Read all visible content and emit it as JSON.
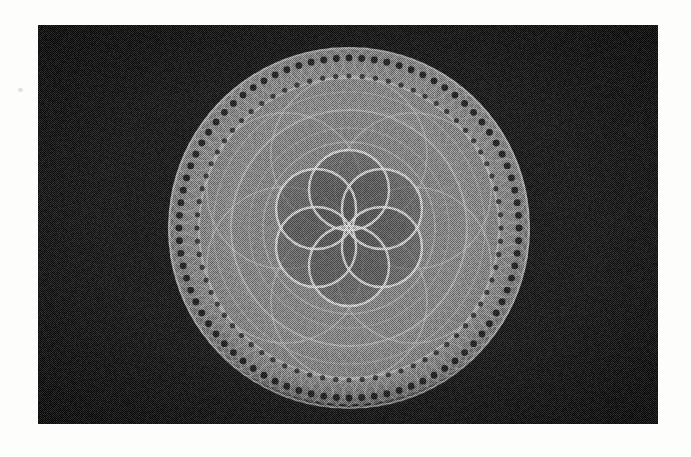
{
  "document": {
    "title": "Rosette moire figure",
    "medium": "halftone scan reproduction",
    "page_background": "#fdfdfc",
    "plate": {
      "x": 38,
      "y": 25,
      "width": 620,
      "height": 399,
      "background_color": "#171717",
      "vignette_color": "#000000"
    }
  },
  "figure": {
    "name": "spirograph-rosette",
    "center_x": 349,
    "center_y": 228,
    "outer_radius": 181,
    "tone": {
      "disk_mid": "#8a8a8a",
      "disk_bright": "#d7d7d7",
      "disk_dark": "#4a4a4a",
      "core_dark": "#565656",
      "dot_color": "#2a2a2a",
      "background": "#1b1b1b"
    },
    "rings": [
      {
        "name": "outer-bead-ring",
        "center_radius": 166,
        "circle_radius": 16,
        "count": 96,
        "stroke": "#c9c9c9",
        "opacity": 0.55,
        "width": 1.0
      },
      {
        "name": "outer-envelope-ring",
        "center_radius": 150,
        "circle_radius": 30,
        "count": 88,
        "stroke": "#bdbdbd",
        "opacity": 0.4,
        "width": 0.9
      },
      {
        "name": "broad-ring",
        "center_radius": 124,
        "circle_radius": 58,
        "count": 80,
        "stroke": "#b5b5b5",
        "opacity": 0.34,
        "width": 0.9
      },
      {
        "name": "mid-ring",
        "center_radius": 96,
        "circle_radius": 74,
        "count": 72,
        "stroke": "#ababab",
        "opacity": 0.3,
        "width": 0.9
      },
      {
        "name": "inner-ring",
        "center_radius": 70,
        "circle_radius": 86,
        "count": 64,
        "stroke": "#a2a2a2",
        "opacity": 0.27,
        "width": 0.9
      },
      {
        "name": "core-ring",
        "center_radius": 46,
        "circle_radius": 92,
        "count": 56,
        "stroke": "#9b9b9b",
        "opacity": 0.24,
        "width": 0.9
      }
    ],
    "bright_arcs": [
      {
        "name": "outer-rim-highlight",
        "radius": 180,
        "stroke": "#e2e2e2",
        "opacity": 0.5,
        "width": 2.0
      },
      {
        "name": "bead-ring-highlight",
        "radius": 150,
        "stroke": "#dedede",
        "opacity": 0.55,
        "width": 2.2
      },
      {
        "name": "ring-2-highlight",
        "radius": 136,
        "stroke": "#cfcfcf",
        "opacity": 0.4,
        "width": 1.6
      },
      {
        "name": "ring-3-highlight",
        "radius": 118,
        "stroke": "#e0e0e0",
        "opacity": 0.55,
        "width": 2.2
      },
      {
        "name": "ring-4-highlight",
        "radius": 100,
        "stroke": "#cccccc",
        "opacity": 0.38,
        "width": 1.4
      },
      {
        "name": "ring-5-highlight",
        "radius": 86,
        "stroke": "#dadada",
        "opacity": 0.45,
        "width": 1.8
      }
    ],
    "rosette": {
      "name": "six-petal-rosette",
      "petal_count": 6,
      "petal_center_radius": 38,
      "petal_radius": 40,
      "stroke": "#ededed",
      "opacity": 0.9,
      "width": 2.4,
      "fill": "#5c5c5c",
      "fill_opacity": 0.55
    },
    "second_rosette": {
      "name": "outer-petal-rosette",
      "petal_count": 6,
      "petal_center_radius": 74,
      "petal_radius": 78,
      "stroke": "#d5d5d5",
      "opacity": 0.5,
      "width": 1.8
    },
    "bead_dots": {
      "name": "outer-bead-dots",
      "count": 84,
      "orbit_radius": 170,
      "dot_radius": 3.4,
      "color": "#101010",
      "opacity": 0.85
    },
    "bead_dots_second": {
      "name": "second-bead-dots",
      "count": 72,
      "orbit_radius": 152,
      "dot_radius": 2.6,
      "color": "#141414",
      "opacity": 0.7
    }
  }
}
